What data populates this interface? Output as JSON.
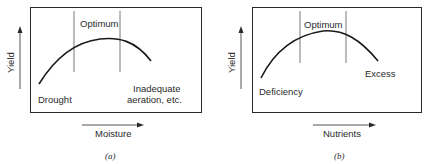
{
  "panels": [
    {
      "id": "a",
      "caption": "(a)",
      "y_axis_label": "Yield",
      "x_axis_label": "Moisture",
      "zone_label": "Optimum",
      "left_label": "Drought",
      "right_label_line1": "Inadequate",
      "right_label_line2": "aeration, etc."
    },
    {
      "id": "b",
      "caption": "(b)",
      "y_axis_label": "Yield",
      "x_axis_label": "Nutrients",
      "zone_label": "Optimum",
      "left_label": "Deficiency",
      "right_label": "Excess"
    }
  ],
  "colors": {
    "line": "#2a2a2a",
    "background": "#ffffff"
  }
}
